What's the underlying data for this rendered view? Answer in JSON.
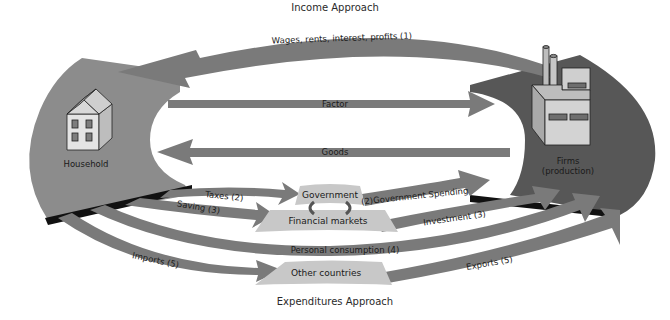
{
  "diagram": {
    "top_title": "Income Approach",
    "bottom_title": "Expenditures Approach",
    "colors": {
      "arrow": "#7a7a7a",
      "household_region": "#8c8c8c",
      "firms_region": "#575757",
      "light_box": "#c8c8c8",
      "dark_edge": "#111111",
      "building_face": "#cfcfcf"
    },
    "nodes": {
      "household": {
        "label": "Household",
        "icon": "house-icon"
      },
      "firms": {
        "label_line1": "Firms",
        "label_line2": "(production)",
        "icon": "factory-icon"
      },
      "government": {
        "label": "Government"
      },
      "financial_markets": {
        "label": "Financial markets"
      },
      "other_countries": {
        "label": "Other countries"
      }
    },
    "flows": {
      "wages": "Wages, rents, interest, profits (1)",
      "factor": "Factor",
      "goods": "Goods",
      "taxes": "Taxes (2)",
      "saving": "Saving (3)",
      "personal_consumption": "Personal consumption (4)",
      "imports": "Imports (5)",
      "government_spending": "(2)Government Spending",
      "investment": "Investment (3)",
      "exports": "Exports (5)"
    }
  }
}
